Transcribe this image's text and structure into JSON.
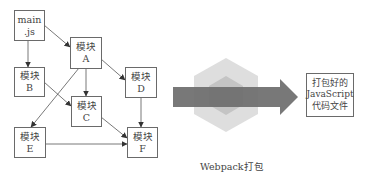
{
  "diagram": {
    "modules": {
      "main": {
        "line1": "main",
        "line2": ".js"
      },
      "A": {
        "line1": "模块",
        "line2": "A"
      },
      "B": {
        "line1": "模块",
        "line2": "B"
      },
      "C": {
        "line1": "模块",
        "line2": "C"
      },
      "D": {
        "line1": "模块",
        "line2": "D"
      },
      "E": {
        "line1": "模块",
        "line2": "E"
      },
      "F": {
        "line1": "模块",
        "line2": "F"
      }
    },
    "edges": [
      {
        "from": "main.js",
        "to": "A"
      },
      {
        "from": "main.js",
        "to": "B"
      },
      {
        "from": "A",
        "to": "C"
      },
      {
        "from": "A",
        "to": "D"
      },
      {
        "from": "A",
        "to": "E"
      },
      {
        "from": "B",
        "to": "C"
      },
      {
        "from": "C",
        "to": "F"
      },
      {
        "from": "D",
        "to": "F"
      },
      {
        "from": "E",
        "to": "F"
      }
    ],
    "bundler": {
      "label": "Webpack打包",
      "icon": "webpack-cube-icon"
    },
    "output": {
      "line1": "打包好的",
      "line2": "JavaScript",
      "line3": "代码文件"
    },
    "colors": {
      "border": "#6a6a6a",
      "arrow": "#6f6f6f",
      "hex_outer": "#dcdcdc",
      "hex_inner": "#c2c2c2",
      "text": "#444444"
    }
  }
}
